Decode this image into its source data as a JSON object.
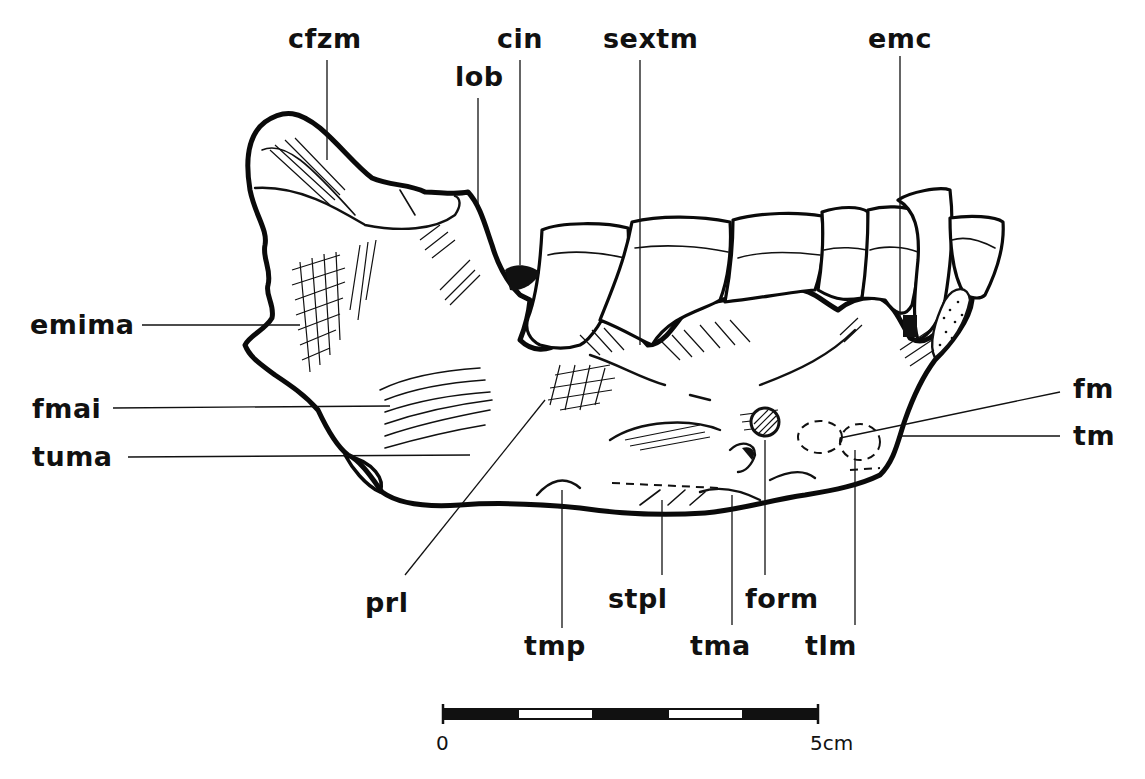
{
  "figure": {
    "colors": {
      "ink": "#111111",
      "background": "#ffffff"
    }
  },
  "labels": [
    {
      "id": "cfzm",
      "text": "cfzm",
      "x": 288,
      "y": 48,
      "leader": [
        [
          327,
          60
        ],
        [
          327,
          160
        ]
      ]
    },
    {
      "id": "cin",
      "text": "cin",
      "x": 497,
      "y": 48,
      "leader": [
        [
          520,
          60
        ],
        [
          520,
          265
        ]
      ]
    },
    {
      "id": "lob",
      "text": "lob",
      "x": 455,
      "y": 86,
      "leader": [
        [
          478,
          98
        ],
        [
          478,
          205
        ]
      ]
    },
    {
      "id": "sextm",
      "text": "sextm",
      "x": 603,
      "y": 48,
      "leader": [
        [
          640,
          60
        ],
        [
          640,
          345
        ]
      ]
    },
    {
      "id": "emc",
      "text": "emc",
      "x": 868,
      "y": 48,
      "leader": [
        [
          900,
          56
        ],
        [
          900,
          320
        ]
      ]
    },
    {
      "id": "emima",
      "text": "emima",
      "x": 30,
      "y": 334,
      "leader": [
        [
          142,
          325
        ],
        [
          300,
          325
        ]
      ]
    },
    {
      "id": "fmai",
      "text": "fmai",
      "x": 32,
      "y": 418,
      "leader": [
        [
          113,
          408
        ],
        [
          390,
          406
        ]
      ]
    },
    {
      "id": "tuma",
      "text": "tuma",
      "x": 32,
      "y": 466,
      "leader": [
        [
          128,
          457
        ],
        [
          470,
          455
        ]
      ]
    },
    {
      "id": "fm",
      "text": "fm",
      "x": 1073,
      "y": 398,
      "leader": [
        [
          1060,
          392
        ],
        [
          840,
          438
        ]
      ]
    },
    {
      "id": "tm",
      "text": "tm",
      "x": 1073,
      "y": 445,
      "leader": [
        [
          1060,
          436
        ],
        [
          900,
          436
        ]
      ]
    },
    {
      "id": "prl",
      "text": "prl",
      "x": 365,
      "y": 612,
      "leader": [
        [
          405,
          575
        ],
        [
          545,
          400
        ]
      ]
    },
    {
      "id": "tmp",
      "text": "tmp",
      "x": 524,
      "y": 655,
      "leader": [
        [
          562,
          628
        ],
        [
          562,
          490
        ]
      ]
    },
    {
      "id": "stpl",
      "text": "stpl",
      "x": 608,
      "y": 608,
      "leader": [
        [
          662,
          575
        ],
        [
          662,
          500
        ]
      ]
    },
    {
      "id": "tma",
      "text": "tma",
      "x": 690,
      "y": 655,
      "leader": [
        [
          732,
          625
        ],
        [
          732,
          495
        ]
      ]
    },
    {
      "id": "form",
      "text": "form",
      "x": 745,
      "y": 608,
      "leader": [
        [
          765,
          575
        ],
        [
          765,
          440
        ]
      ]
    },
    {
      "id": "tlm",
      "text": "tlm",
      "x": 805,
      "y": 655,
      "leader": [
        [
          855,
          625
        ],
        [
          855,
          450
        ]
      ]
    }
  ],
  "scale_bar": {
    "x_start": 443,
    "x_end": 818,
    "y": 714,
    "start_label": "0",
    "end_label": "5cm",
    "segments": 5,
    "unit": "cm",
    "length": 5
  }
}
